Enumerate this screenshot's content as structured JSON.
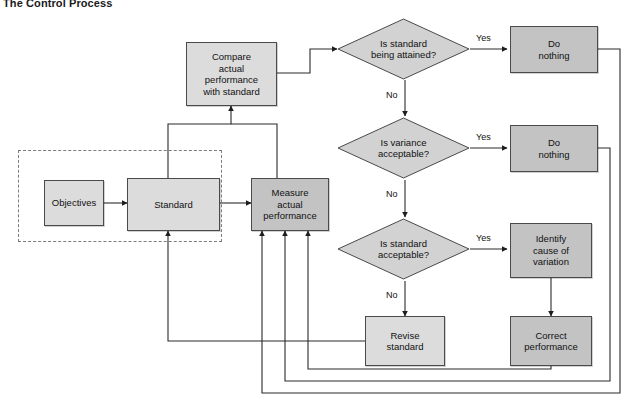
{
  "title": "The Control Process",
  "colors": {
    "box_dark": "#c3c3c3",
    "box_light": "#dcdcdc",
    "diamond_fill": "#d2d2d2",
    "stroke": "#4a4a4a",
    "line": "#2b2b2b",
    "dashed_group": "#7c7c7c",
    "background": "#ffffff"
  },
  "nodes": {
    "objectives": {
      "label": "Objectives",
      "shape": "rectangle",
      "fill": "light"
    },
    "standard": {
      "label": "Standard",
      "shape": "rectangle",
      "fill": "light"
    },
    "measure": {
      "label": "Measure\nactual\nperformance",
      "shape": "rectangle",
      "fill": "dark"
    },
    "compare": {
      "label": "Compare\nactual\nperformance\nwith standard",
      "shape": "rectangle",
      "fill": "light"
    },
    "decision_attained": {
      "label": "Is standard\nbeing attained?",
      "shape": "diamond",
      "fill": "diamond"
    },
    "decision_variance": {
      "label": "Is variance\nacceptable?",
      "shape": "diamond",
      "fill": "diamond"
    },
    "decision_standard_ok": {
      "label": "Is standard\nacceptable?",
      "shape": "diamond",
      "fill": "diamond"
    },
    "do_nothing_1": {
      "label": "Do\nnothing",
      "shape": "rectangle",
      "fill": "dark"
    },
    "do_nothing_2": {
      "label": "Do\nnothing",
      "shape": "rectangle",
      "fill": "dark"
    },
    "identify_cause": {
      "label": "Identify\ncause of\nvariation",
      "shape": "rectangle",
      "fill": "dark"
    },
    "revise_standard": {
      "label": "Revise\nstandard",
      "shape": "rectangle",
      "fill": "light"
    },
    "correct_performance": {
      "label": "Correct\nperformance",
      "shape": "rectangle",
      "fill": "dark"
    }
  },
  "edge_labels": {
    "yes_1": "Yes",
    "no_1": "No",
    "yes_2": "Yes",
    "no_2": "No",
    "yes_3": "Yes",
    "no_3": "No"
  },
  "edges": [
    {
      "from": "objectives",
      "to": "standard",
      "label": ""
    },
    {
      "from": "standard",
      "to": "measure",
      "label": ""
    },
    {
      "from": "standard",
      "to": "compare",
      "label": ""
    },
    {
      "from": "measure",
      "to": "compare",
      "label": ""
    },
    {
      "from": "compare",
      "to": "decision_attained",
      "label": ""
    },
    {
      "from": "decision_attained",
      "to": "do_nothing_1",
      "label": "Yes"
    },
    {
      "from": "decision_attained",
      "to": "decision_variance",
      "label": "No"
    },
    {
      "from": "decision_variance",
      "to": "do_nothing_2",
      "label": "Yes"
    },
    {
      "from": "decision_variance",
      "to": "decision_standard_ok",
      "label": "No"
    },
    {
      "from": "decision_standard_ok",
      "to": "identify_cause",
      "label": "Yes"
    },
    {
      "from": "decision_standard_ok",
      "to": "revise_standard",
      "label": "No"
    },
    {
      "from": "identify_cause",
      "to": "correct_performance",
      "label": ""
    },
    {
      "from": "revise_standard",
      "to": "standard",
      "label": ""
    },
    {
      "from": "do_nothing_1",
      "to": "measure",
      "label": ""
    },
    {
      "from": "do_nothing_2",
      "to": "measure",
      "label": ""
    },
    {
      "from": "correct_performance",
      "to": "measure",
      "label": ""
    }
  ],
  "dashed_group_label": ""
}
